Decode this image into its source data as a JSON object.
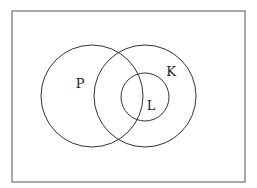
{
  "diagram": {
    "type": "venn",
    "universe": {
      "x": 12,
      "y": 11,
      "width": 233,
      "height": 171,
      "stroke": "#555555"
    },
    "sets": [
      {
        "label": "P",
        "cx": 92,
        "cy": 96,
        "r": 51,
        "label_x": 80,
        "label_y": 88
      },
      {
        "label": "K",
        "cx": 145,
        "cy": 96,
        "r": 51,
        "label_x": 171,
        "label_y": 76
      },
      {
        "label": "L",
        "cx": 145,
        "cy": 97,
        "r": 24,
        "label_x": 151,
        "label_y": 110
      }
    ],
    "stroke_color": "#333333",
    "relations": [
      "L is a subset of K",
      "P overlaps K",
      "P overlaps L"
    ]
  }
}
